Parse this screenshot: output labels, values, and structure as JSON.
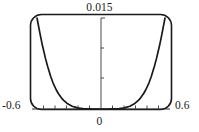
{
  "figure": {
    "frame_color": "#1a1a1a",
    "curve_color": "#1a1a1a",
    "axis_color": "#3c3c3c",
    "background": "#ffffff"
  },
  "labels": {
    "y_max": "0.015",
    "x_min": "-0.6",
    "x_max": "0.6",
    "x_zero": "0"
  },
  "chart_data": {
    "type": "line",
    "title": "",
    "xlabel": "",
    "ylabel": "",
    "xlim": [
      -0.6,
      0.6
    ],
    "ylim": [
      0,
      0.015
    ],
    "grid": false,
    "legend": null,
    "frame": "rounded-rectangle",
    "x_ticks": [
      -0.5,
      -0.4,
      -0.3,
      -0.2,
      -0.1,
      0,
      0.1,
      0.2,
      0.3,
      0.4,
      0.5
    ],
    "x_tick_labels": [
      "-0.6",
      "0",
      "0.6"
    ],
    "y_ticks": [
      0.005,
      0.01,
      0.015
    ],
    "y_tick_labels": [
      "0.015"
    ],
    "series": [
      {
        "name": "f(x)",
        "x": [
          -0.6,
          -0.57,
          -0.55,
          -0.52,
          -0.5,
          -0.47,
          -0.45,
          -0.42,
          -0.4,
          -0.37,
          -0.35,
          -0.32,
          -0.3,
          -0.27,
          -0.25,
          -0.22,
          -0.2,
          -0.17,
          -0.15,
          -0.12,
          -0.1,
          -0.07,
          -0.05,
          -0.02,
          0,
          0.02,
          0.05,
          0.07,
          0.1,
          0.12,
          0.15,
          0.17,
          0.2,
          0.22,
          0.25,
          0.27,
          0.3,
          0.32,
          0.35,
          0.37,
          0.4,
          0.42,
          0.45,
          0.47,
          0.5,
          0.52,
          0.55,
          0.57,
          0.6
        ],
        "y": [
          0.015,
          0.01226,
          0.01054,
          0.0083,
          0.007,
          0.00528,
          0.00432,
          0.00317,
          0.00256,
          0.0018,
          0.00142,
          0.00096,
          0.00074,
          0.00046,
          0.00034,
          0.00019,
          0.000133,
          6.55e-05,
          4.24e-05,
          1.63e-05,
          8.8e-06,
          1.9e-06,
          6.9e-07,
          2e-08,
          0.0,
          2e-08,
          6.9e-07,
          1.9e-06,
          8.8e-06,
          1.63e-05,
          4.24e-05,
          6.55e-05,
          0.000133,
          0.00019,
          0.00034,
          0.00046,
          0.00074,
          0.00096,
          0.00142,
          0.0018,
          0.00256,
          0.00317,
          0.00432,
          0.00528,
          0.007,
          0.0083,
          0.01054,
          0.01226,
          0.015
        ]
      }
    ]
  }
}
